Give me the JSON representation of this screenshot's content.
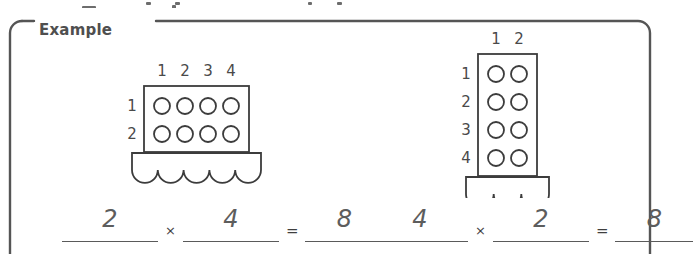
{
  "frame": {
    "label": "Example",
    "border_color": "#555555"
  },
  "artifacts": [
    {
      "x": 146,
      "y": 2,
      "w": 5,
      "h": 3
    },
    {
      "x": 175,
      "y": 2,
      "w": 5,
      "h": 3
    },
    {
      "x": 308,
      "y": 2,
      "w": 4,
      "h": 3
    },
    {
      "x": 337,
      "y": 2,
      "w": 5,
      "h": 3
    },
    {
      "x": 82,
      "y": 6,
      "w": 14,
      "h": 3
    },
    {
      "x": 172,
      "y": 5,
      "w": 4,
      "h": 4
    }
  ],
  "diagrams": [
    {
      "name": "array-2-by-4",
      "rows": 2,
      "cols": 4,
      "column_labels": [
        "1",
        "2",
        "3",
        "4"
      ],
      "row_labels": [
        "1",
        "2"
      ],
      "scallops": 5,
      "total_dots": 8
    },
    {
      "name": "array-4-by-2",
      "rows": 4,
      "cols": 2,
      "column_labels": [
        "1",
        "2"
      ],
      "row_labels": [
        "1",
        "2",
        "3",
        "4"
      ],
      "scallops": 3,
      "total_dots": 8
    }
  ],
  "equations": [
    {
      "name": "equation-rows-times-columns",
      "factor1": "2",
      "multiply_symbol": "×",
      "factor2": "4",
      "equals_symbol": "=",
      "product": "8"
    },
    {
      "name": "equation-columns-times-rows",
      "factor1": "4",
      "multiply_symbol": "×",
      "factor2": "2",
      "equals_symbol": "=",
      "product": "8"
    }
  ]
}
